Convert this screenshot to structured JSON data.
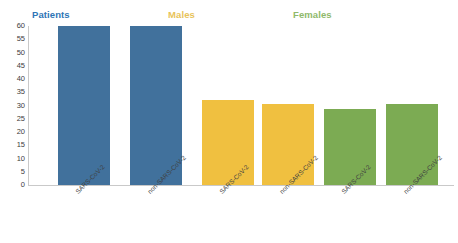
{
  "chart_data": {
    "type": "bar",
    "title": "",
    "xlabel": "",
    "ylabel": "",
    "ylim": [
      0,
      60
    ],
    "ytick_step": 5,
    "yticks": [
      0,
      5,
      10,
      15,
      20,
      25,
      30,
      35,
      40,
      45,
      50,
      55,
      60
    ],
    "grid": false,
    "legend_position": "top-inline-group-titles",
    "groups": [
      {
        "name": "Patients",
        "color": "#2E75B6"
      },
      {
        "name": "Males",
        "color": "#E8B93C"
      },
      {
        "name": "Females",
        "color": "#70AD47"
      }
    ],
    "categories": [
      "SARS-CoV-2",
      "non-SARS-CoV-2",
      "SARS-CoV-2",
      "non-SARS-CoV-2",
      "SARS-CoV-2",
      "non-SARS-CoV-2"
    ],
    "values": [
      60,
      60,
      32,
      30.5,
      28.5,
      30.5
    ],
    "bars": [
      {
        "label": "SARS-CoV-2",
        "group": "Patients",
        "value": 60,
        "color": "#41719C"
      },
      {
        "label": "non-SARS-CoV-2",
        "group": "Patients",
        "value": 60,
        "color": "#41719C"
      },
      {
        "label": "SARS-CoV-2",
        "group": "Males",
        "value": 32,
        "color": "#F0C040"
      },
      {
        "label": "non-SARS-CoV-2",
        "group": "Males",
        "value": 30.5,
        "color": "#F0C040"
      },
      {
        "label": "SARS-CoV-2",
        "group": "Females",
        "value": 28.5,
        "color": "#7CAB53"
      },
      {
        "label": "non-SARS-CoV-2",
        "group": "Females",
        "value": 30.5,
        "color": "#7CAB53"
      }
    ]
  },
  "titles": {
    "patients": "Patients",
    "males": "Males",
    "females": "Females"
  },
  "colors": {
    "patients_title": "#2E75B6",
    "males_title": "#E8C35A",
    "females_title": "#8FB96B",
    "bar_blue": "#41719C",
    "bar_gold": "#F0C040",
    "bar_green": "#7CAB53",
    "axis": "#c9c9c9",
    "tick_text": "#3d3d3d",
    "background": "#ffffff"
  }
}
